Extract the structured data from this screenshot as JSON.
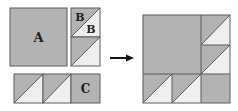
{
  "diagram": {
    "colors": {
      "gray": "#b3b3b3",
      "light": "#efefef",
      "line": "#5a5a5a",
      "arrow": "#111111"
    },
    "pieces": {
      "a_label": "A",
      "b_label_dark": "B",
      "b_label_light": "B",
      "c_label": "C"
    },
    "arrow": {
      "direction": "right",
      "icon": "arrow-right-icon"
    },
    "result": {
      "grid": "3x3",
      "description": "Assembled block: A square with B half-square triangles and C strip"
    }
  }
}
